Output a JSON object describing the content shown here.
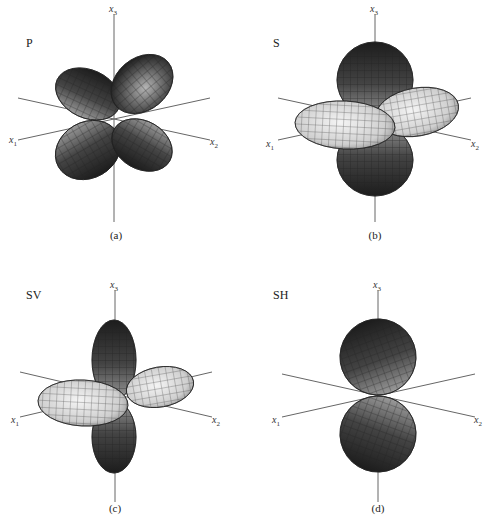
{
  "figure": {
    "panels": [
      {
        "id": "a",
        "title": "P",
        "caption": "(a)",
        "axes": [
          "x1",
          "x2",
          "x3"
        ]
      },
      {
        "id": "b",
        "title": "S",
        "caption": "(b)",
        "axes": [
          "x1",
          "x2",
          "x3"
        ]
      },
      {
        "id": "c",
        "title": "SV",
        "caption": "(c)",
        "axes": [
          "x1",
          "x2",
          "x3"
        ]
      },
      {
        "id": "d",
        "title": "SH",
        "caption": "(d)",
        "axes": [
          "x1",
          "x2",
          "x3"
        ]
      }
    ],
    "axis_labels": {
      "x1": "x",
      "x1_sub": "1",
      "x2": "x",
      "x2_sub": "2",
      "x3": "x",
      "x3_sub": "3"
    },
    "colors": {
      "dark": "#2a2a2a",
      "mid": "#777777",
      "light": "#e4e4e4",
      "axis": "#555555"
    }
  }
}
